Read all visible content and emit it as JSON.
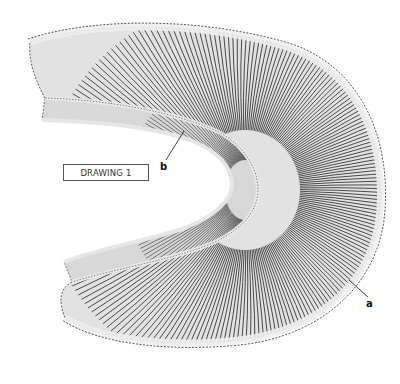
{
  "figure": {
    "caption": "DRAWING 1",
    "labels": [
      {
        "id": "a",
        "text": "a"
      },
      {
        "id": "b",
        "text": "b"
      }
    ]
  },
  "colors": {
    "background": "#ffffff",
    "band_fill": "#dcdcdc",
    "stripe": "#1a1a1a",
    "outline": "#222222",
    "caption_border": "#555555"
  }
}
